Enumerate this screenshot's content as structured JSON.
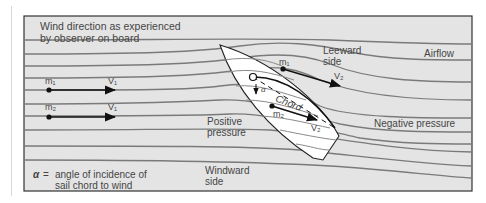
{
  "figure": {
    "title_line1": "Wind direction as experienced",
    "title_line2": "by observer on board",
    "airflow_label": "Airflow",
    "leeward_line1": "Leeward",
    "leeward_line2": "side",
    "windward_line1": "Windward",
    "windward_line2": "side",
    "positive_line1": "Positive",
    "positive_line2": "pressure",
    "negative_label": "Negative pressure",
    "chord_label": "Chord",
    "alpha_symbol": "α",
    "legend_symbol": "α",
    "legend_eq": "=",
    "legend_line1": "angle of incidence of",
    "legend_line2": "sail chord to wind",
    "particles": [
      {
        "mass": "m₁",
        "velocity": "V₁"
      },
      {
        "mass": "m₂",
        "velocity": "V₁"
      },
      {
        "mass": "m₁",
        "velocity": "V₂"
      },
      {
        "mass": "m₂",
        "velocity": "V₂"
      }
    ],
    "colors": {
      "background": "#e4e4e4",
      "frame": "#333333",
      "streamline": "#7a7a7a",
      "boat": "#ffffff",
      "arrow": "#111111",
      "text": "#444444"
    }
  }
}
